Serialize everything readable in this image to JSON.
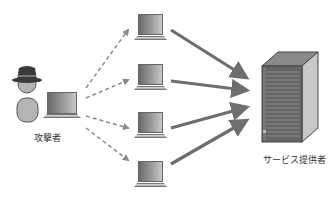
{
  "diagram": {
    "type": "ddos-attack-illustration",
    "nodes": {
      "attacker": {
        "label": "攻撃者",
        "icon": "person-with-hat-icon"
      },
      "attacker_pc": {
        "icon": "laptop-icon"
      },
      "bots": [
        {
          "icon": "laptop-icon"
        },
        {
          "icon": "laptop-icon"
        },
        {
          "icon": "laptop-icon"
        },
        {
          "icon": "laptop-icon"
        }
      ],
      "server": {
        "label": "サービス提供者",
        "icon": "server-tower-icon"
      }
    },
    "edges": {
      "attacker_to_bots": {
        "style": "dashed",
        "count": 4
      },
      "bots_to_server": {
        "style": "solid-thick",
        "count": 4
      }
    },
    "colors": {
      "arrow": "#6e6e6e",
      "dashed_arrow": "#8a8a8a",
      "server_front": "#666666",
      "server_side": "#c8c8c8",
      "server_top": "#8a8a8a",
      "hat": "#3a3a3a",
      "person": "#b4b4b4"
    }
  }
}
